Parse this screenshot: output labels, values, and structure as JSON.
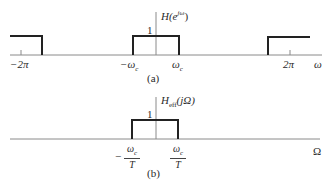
{
  "figure": {
    "panel_a": {
      "caption": "(a)",
      "function_label": "H(e^{jω})",
      "function_label_main": "H(e",
      "function_label_sup": "jω",
      "function_label_close": ")",
      "height_label": "1",
      "axis_label": "ω",
      "ticks": [
        {
          "label": "−2π",
          "position": "-2pi"
        },
        {
          "label": "−ω",
          "sub": "c",
          "position": "-wc"
        },
        {
          "label": "ω",
          "sub": "c",
          "position": "wc"
        },
        {
          "label": "2π",
          "position": "2pi"
        }
      ],
      "description": "Periodic ideal lowpass filter with unit gain passbands centered at 0 and ±2π"
    },
    "panel_b": {
      "caption": "(b)",
      "function_label_main": "H",
      "function_label_sub": "eff",
      "function_label_arg": "(jΩ)",
      "height_label": "1",
      "axis_label": "Ω",
      "ticks": [
        {
          "num": "ω",
          "num_sub": "c",
          "den": "T",
          "sign": "−",
          "position": "-wc/T"
        },
        {
          "num": "ω",
          "num_sub": "c",
          "den": "T",
          "sign": "",
          "position": "wc/T"
        }
      ],
      "description": "Effective continuous-time ideal lowpass filter with unit gain between −ωc/T and ωc/T"
    }
  }
}
